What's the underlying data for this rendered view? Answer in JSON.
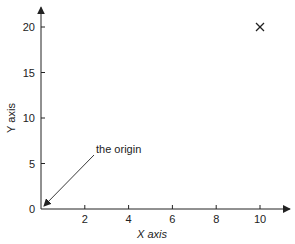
{
  "chart_data": {
    "type": "scatter",
    "title": "",
    "xlabel": "X axis",
    "ylabel": "Y axis",
    "xlim": [
      0,
      11
    ],
    "ylim": [
      0,
      21.5
    ],
    "x_ticks": [
      2,
      4,
      6,
      8,
      10
    ],
    "y_ticks": [
      0,
      5,
      10,
      15,
      20
    ],
    "grid": false,
    "series": [
      {
        "name": "point",
        "marker": "x",
        "points": [
          {
            "x": 10,
            "y": 20
          }
        ]
      }
    ],
    "annotations": [
      {
        "text": "the origin",
        "arrow_to": {
          "x": 0,
          "y": 0
        }
      }
    ],
    "colors": {
      "axis": "#222222",
      "marker": "#222222"
    }
  }
}
